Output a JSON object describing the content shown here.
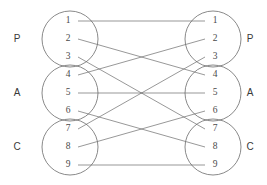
{
  "diagram": {
    "type": "bipartite-permutation-graph",
    "geometry": {
      "width": 267,
      "height": 185,
      "left_column_x": 70,
      "right_column_x": 213,
      "circle_radius": 28,
      "node_row_spacing": 18,
      "group_center_ys": [
        39,
        93,
        147
      ],
      "node_label_offset_x_left": -2,
      "node_label_offset_x_right": 2,
      "edge_start_x_left": 78,
      "edge_end_x_right": 205
    },
    "left_groups": [
      {
        "label": "P",
        "label_x": 17,
        "label_y": 39,
        "center_y": 39,
        "nodes": [
          {
            "label": "1",
            "y": 21
          },
          {
            "label": "2",
            "y": 39
          },
          {
            "label": "3",
            "y": 57
          }
        ]
      },
      {
        "label": "A",
        "label_x": 17,
        "label_y": 93,
        "center_y": 93,
        "nodes": [
          {
            "label": "4",
            "y": 75
          },
          {
            "label": "5",
            "y": 93
          },
          {
            "label": "6",
            "y": 111
          }
        ]
      },
      {
        "label": "C",
        "label_x": 17,
        "label_y": 147,
        "center_y": 147,
        "nodes": [
          {
            "label": "7",
            "y": 129
          },
          {
            "label": "8",
            "y": 147
          },
          {
            "label": "9",
            "y": 165
          }
        ]
      }
    ],
    "right_groups": [
      {
        "label": "P",
        "label_x": 250,
        "label_y": 39,
        "center_y": 39,
        "nodes": [
          {
            "label": "1",
            "y": 21
          },
          {
            "label": "2",
            "y": 39
          },
          {
            "label": "3",
            "y": 57
          }
        ]
      },
      {
        "label": "A",
        "label_x": 250,
        "label_y": 93,
        "center_y": 93,
        "nodes": [
          {
            "label": "4",
            "y": 75
          },
          {
            "label": "5",
            "y": 93
          },
          {
            "label": "6",
            "y": 111
          }
        ]
      },
      {
        "label": "C",
        "label_x": 250,
        "label_y": 147,
        "center_y": 147,
        "nodes": [
          {
            "label": "7",
            "y": 129
          },
          {
            "label": "8",
            "y": 147
          },
          {
            "label": "9",
            "y": 165
          }
        ]
      }
    ],
    "edges": [
      {
        "from": "1",
        "to": "1",
        "y1": 21,
        "y2": 21
      },
      {
        "from": "2",
        "to": "4",
        "y1": 39,
        "y2": 75
      },
      {
        "from": "3",
        "to": "7",
        "y1": 57,
        "y2": 129
      },
      {
        "from": "4",
        "to": "2",
        "y1": 75,
        "y2": 39
      },
      {
        "from": "5",
        "to": "5",
        "y1": 93,
        "y2": 93
      },
      {
        "from": "6",
        "to": "8",
        "y1": 111,
        "y2": 147
      },
      {
        "from": "7",
        "to": "3",
        "y1": 129,
        "y2": 57
      },
      {
        "from": "8",
        "to": "6",
        "y1": 147,
        "y2": 111
      },
      {
        "from": "9",
        "to": "9",
        "y1": 165,
        "y2": 165
      }
    ],
    "colors": {
      "stroke": "#6b6b6b",
      "node_text": "#4a4a4a",
      "side_text": "#3a3a3a",
      "background": "#ffffff"
    }
  }
}
